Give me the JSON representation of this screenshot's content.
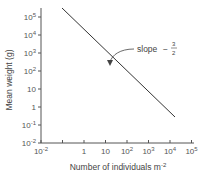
{
  "chart_data": {
    "type": "line",
    "title": "",
    "xlabel": "Number of individuals m",
    "xlabel_sup": "-2",
    "ylabel": "Mean weight (g)",
    "xscale": "log",
    "yscale": "log",
    "xlim": [
      0.01,
      100000
    ],
    "ylim": [
      0.01,
      100000
    ],
    "x_ticks": [
      {
        "value": 0.01,
        "base": "10",
        "exp": "-2"
      },
      {
        "value": 0.1,
        "base": "",
        "exp": ""
      },
      {
        "value": 1,
        "base": "1",
        "exp": ""
      },
      {
        "value": 10,
        "base": "10",
        "exp": ""
      },
      {
        "value": 100,
        "base": "10",
        "exp": "2"
      },
      {
        "value": 1000,
        "base": "10",
        "exp": "3"
      },
      {
        "value": 10000,
        "base": "10",
        "exp": "4"
      },
      {
        "value": 100000,
        "base": "10",
        "exp": "5"
      }
    ],
    "y_ticks": [
      {
        "value": 100000,
        "base": "10",
        "exp": "5"
      },
      {
        "value": 10000,
        "base": "10",
        "exp": "4"
      },
      {
        "value": 1000,
        "base": "10",
        "exp": "3"
      },
      {
        "value": 100,
        "base": "10",
        "exp": "2"
      },
      {
        "value": 10,
        "base": "10",
        "exp": ""
      },
      {
        "value": 1,
        "base": "1",
        "exp": ""
      },
      {
        "value": 0.1,
        "base": "10",
        "exp": "-1"
      },
      {
        "value": 0.01,
        "base": "10",
        "exp": "-2"
      }
    ],
    "series": [
      {
        "name": "self-thinning line",
        "x": [
          0.1,
          16000
        ],
        "y": [
          300000,
          2.5
        ]
      }
    ],
    "annotations": [
      {
        "text": "slope",
        "value": "−",
        "fraction_num": "3",
        "fraction_den": "2",
        "arrow_to": {
          "x": 30,
          "y": 800
        }
      }
    ],
    "grid": false,
    "legend": null
  }
}
